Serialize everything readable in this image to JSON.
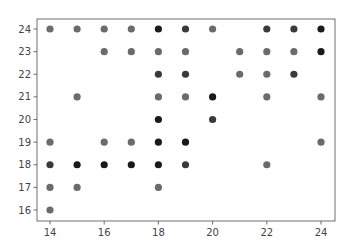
{
  "chart_data": {
    "type": "scatter",
    "title": "",
    "xlabel": "",
    "ylabel": "",
    "xlim": [
      13.5,
      24.5
    ],
    "ylim": [
      15.5,
      24.4
    ],
    "grid": false,
    "legend": null,
    "x_ticks": [
      14,
      16,
      18,
      20,
      22,
      24
    ],
    "y_ticks": [
      16,
      17,
      18,
      19,
      20,
      21,
      22,
      23,
      24
    ],
    "marker_colors": {
      "light": "#6b6b6b",
      "dark": "#3a3a3a",
      "black": "#1a1a1a"
    },
    "points": [
      {
        "x": 14,
        "y": 24,
        "shade": "light"
      },
      {
        "x": 15,
        "y": 24,
        "shade": "light"
      },
      {
        "x": 16,
        "y": 24,
        "shade": "light"
      },
      {
        "x": 17,
        "y": 24,
        "shade": "light"
      },
      {
        "x": 18,
        "y": 24,
        "shade": "black"
      },
      {
        "x": 19,
        "y": 24,
        "shade": "dark"
      },
      {
        "x": 20,
        "y": 24,
        "shade": "light"
      },
      {
        "x": 22,
        "y": 24,
        "shade": "dark"
      },
      {
        "x": 23,
        "y": 24,
        "shade": "dark"
      },
      {
        "x": 24,
        "y": 24,
        "shade": "black"
      },
      {
        "x": 16,
        "y": 23,
        "shade": "light"
      },
      {
        "x": 17,
        "y": 23,
        "shade": "light"
      },
      {
        "x": 18,
        "y": 23,
        "shade": "light"
      },
      {
        "x": 19,
        "y": 23,
        "shade": "light"
      },
      {
        "x": 21,
        "y": 23,
        "shade": "light"
      },
      {
        "x": 22,
        "y": 23,
        "shade": "light"
      },
      {
        "x": 23,
        "y": 23,
        "shade": "light"
      },
      {
        "x": 24,
        "y": 23,
        "shade": "black"
      },
      {
        "x": 18,
        "y": 22,
        "shade": "dark"
      },
      {
        "x": 19,
        "y": 22,
        "shade": "dark"
      },
      {
        "x": 21,
        "y": 22,
        "shade": "light"
      },
      {
        "x": 22,
        "y": 22,
        "shade": "light"
      },
      {
        "x": 23,
        "y": 22,
        "shade": "dark"
      },
      {
        "x": 15,
        "y": 21,
        "shade": "light"
      },
      {
        "x": 18,
        "y": 21,
        "shade": "light"
      },
      {
        "x": 19,
        "y": 21,
        "shade": "light"
      },
      {
        "x": 20,
        "y": 21,
        "shade": "black"
      },
      {
        "x": 22,
        "y": 21,
        "shade": "light"
      },
      {
        "x": 24,
        "y": 21,
        "shade": "light"
      },
      {
        "x": 18,
        "y": 20,
        "shade": "black"
      },
      {
        "x": 20,
        "y": 20,
        "shade": "dark"
      },
      {
        "x": 14,
        "y": 19,
        "shade": "light"
      },
      {
        "x": 16,
        "y": 19,
        "shade": "light"
      },
      {
        "x": 17,
        "y": 19,
        "shade": "light"
      },
      {
        "x": 18,
        "y": 19,
        "shade": "black"
      },
      {
        "x": 19,
        "y": 19,
        "shade": "black"
      },
      {
        "x": 24,
        "y": 19,
        "shade": "light"
      },
      {
        "x": 14,
        "y": 18,
        "shade": "dark"
      },
      {
        "x": 15,
        "y": 18,
        "shade": "black"
      },
      {
        "x": 16,
        "y": 18,
        "shade": "black"
      },
      {
        "x": 17,
        "y": 18,
        "shade": "black"
      },
      {
        "x": 18,
        "y": 18,
        "shade": "black"
      },
      {
        "x": 19,
        "y": 18,
        "shade": "dark"
      },
      {
        "x": 22,
        "y": 18,
        "shade": "light"
      },
      {
        "x": 14,
        "y": 17,
        "shade": "light"
      },
      {
        "x": 15,
        "y": 17,
        "shade": "light"
      },
      {
        "x": 18,
        "y": 17,
        "shade": "light"
      },
      {
        "x": 14,
        "y": 16,
        "shade": "light"
      }
    ]
  }
}
